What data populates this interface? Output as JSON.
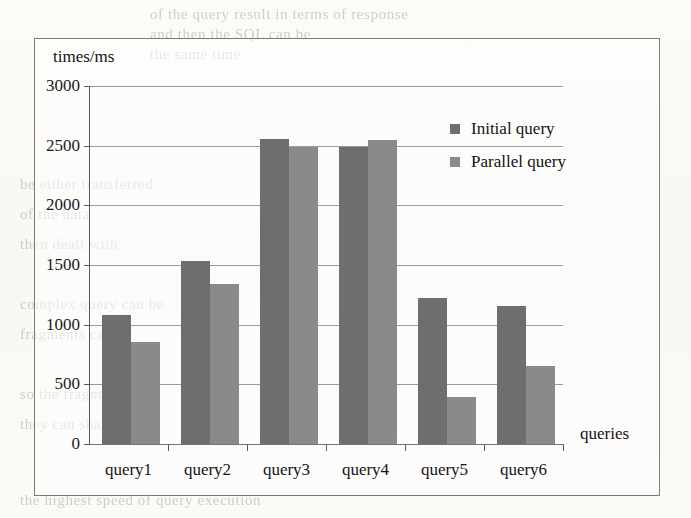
{
  "page": {
    "background_ghost_lines": [
      {
        "text": "of the query result in terms of response",
        "x": 150,
        "y": 6
      },
      {
        "text": "and then the SQL can be",
        "x": 150,
        "y": 26
      },
      {
        "text": "the same time",
        "x": 150,
        "y": 46
      },
      {
        "text": "be either transferred",
        "x": 20,
        "y": 176
      },
      {
        "text": "of the data",
        "x": 20,
        "y": 206
      },
      {
        "text": "then dealt with",
        "x": 20,
        "y": 236
      },
      {
        "text": "complex query can be",
        "x": 20,
        "y": 296
      },
      {
        "text": "fragments can be",
        "x": 20,
        "y": 326
      },
      {
        "text": "so the fragments",
        "x": 20,
        "y": 386
      },
      {
        "text": "they can share the",
        "x": 20,
        "y": 416
      },
      {
        "text": "the highest speed of query execution",
        "x": 20,
        "y": 492
      }
    ]
  },
  "chart_data": {
    "type": "bar",
    "title": "",
    "xlabel": "queries",
    "ylabel": "times/ms",
    "categories": [
      "query1",
      "query2",
      "query3",
      "query4",
      "query5",
      "query6"
    ],
    "series": [
      {
        "name": "Initial query",
        "color": "#6e6e6e",
        "values": [
          1080,
          1530,
          2555,
          2490,
          1225,
          1160
        ]
      },
      {
        "name": "Parallel query",
        "color": "#8a8a8a",
        "values": [
          855,
          1345,
          2485,
          2545,
          395,
          655
        ]
      }
    ],
    "ylim": [
      0,
      3000
    ],
    "yticks": [
      0,
      500,
      1000,
      1500,
      2000,
      2500,
      3000
    ],
    "ytick_labels": [
      "0",
      "500",
      "1000",
      "1500",
      "2000",
      "2500",
      "3000"
    ],
    "grid": true,
    "legend_position": "top-right"
  }
}
